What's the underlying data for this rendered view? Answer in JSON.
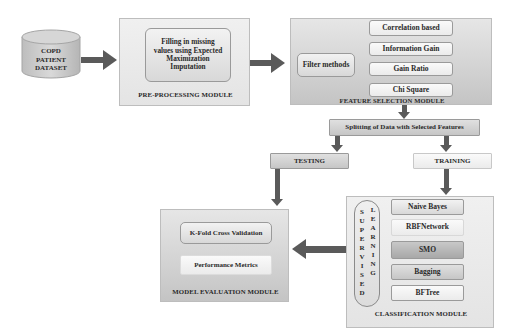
{
  "dataset": {
    "label_lines": [
      "COPD",
      "PATIENT",
      "DATASET"
    ]
  },
  "preprocessing": {
    "title": "PRE-PROCESSING MODULE",
    "step_lines": [
      "Filling in missing",
      "values using Expected",
      "Maximization",
      "Imputation"
    ]
  },
  "feature_selection": {
    "title": "FEATURE SELECTION MODULE",
    "filter_label": "Filter methods",
    "methods": [
      "Correlation based",
      "Information Gain",
      "Gain Ratio",
      "Chi Square"
    ]
  },
  "splitting": {
    "label": "Splitting of Data with Selected Features"
  },
  "testing": {
    "label": "TESTING"
  },
  "training": {
    "label": "TRAINING"
  },
  "classification": {
    "title": "CLASSIFICATION MODULE",
    "vertical_word_1": [
      "S",
      "U",
      "P",
      "E",
      "R",
      "V",
      "I",
      "S",
      "E",
      "D"
    ],
    "vertical_word_2": [
      "L",
      "E",
      "A",
      "R",
      "N",
      "I",
      "N",
      "G"
    ],
    "classifiers": [
      "Naive Bayes",
      "RBFNetwork",
      "SMO",
      "Bagging",
      "BFTree"
    ]
  },
  "evaluation": {
    "title": "MODEL EVALUATION MODULE",
    "items": [
      "K-Fold Cross Validation",
      "Performance Metrics"
    ]
  }
}
